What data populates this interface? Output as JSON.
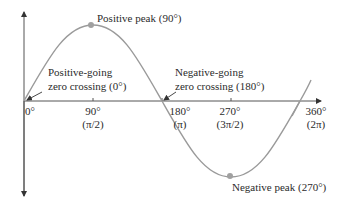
{
  "diagram": {
    "type": "sine-wave",
    "colors": {
      "curve": "#9a9a9a",
      "axis": "#555555",
      "marker": "#a0a0a0",
      "text": "#2b2b2b"
    },
    "annotations": {
      "positive_peak": "Positive peak (90°)",
      "negative_peak": "Negative peak (270°)",
      "positive_zero_line1": "Positive-going",
      "positive_zero_line2": "zero crossing (0°)",
      "negative_zero_line1": "Negative-going",
      "negative_zero_line2": "zero crossing (180°)"
    },
    "ticks": [
      {
        "deg": "0°",
        "rad": ""
      },
      {
        "deg": "90°",
        "rad": "(π/2)"
      },
      {
        "deg": "180°",
        "rad": "(π)"
      },
      {
        "deg": "270°",
        "rad": "(3π/2)"
      },
      {
        "deg": "360°",
        "rad": "(2π)"
      }
    ]
  }
}
